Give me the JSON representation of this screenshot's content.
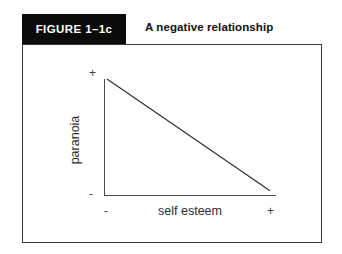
{
  "figure": {
    "badge_label": "FIGURE 1–1c",
    "title": "A negative relationship",
    "badge_bg": "#0b0b0b",
    "badge_text_color": "#ffffff",
    "border_color": "#3a3a3e",
    "page_bg": "#fdfdfd"
  },
  "axes": {
    "y_label": "paranoia",
    "x_label": "self esteem",
    "y_high_marker": "+",
    "y_low_marker": "-",
    "x_low_marker": "-",
    "x_high_marker": "+",
    "axis_color": "#4a4a4e"
  },
  "chart_data": {
    "type": "line",
    "title": "A negative relationship",
    "xlabel": "self esteem",
    "ylabel": "paranoia",
    "xlim": [
      0,
      100
    ],
    "ylim": [
      0,
      100
    ],
    "grid": false,
    "legend": "none",
    "x_tick_labels": [
      "-",
      "+"
    ],
    "y_tick_labels": [
      "-",
      "+"
    ],
    "line_color": "#2b2b2e",
    "series": [
      {
        "name": "negative relationship",
        "x": [
          0,
          100
        ],
        "y": [
          100,
          2
        ]
      }
    ]
  }
}
